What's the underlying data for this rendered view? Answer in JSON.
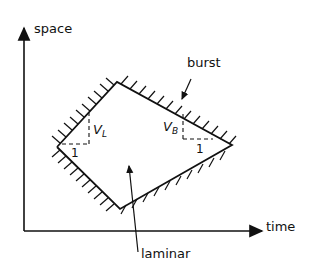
{
  "diagram": {
    "axes": {
      "y_label": "space",
      "x_label": "time"
    },
    "regions": {
      "burst_label": "burst",
      "laminar_label": "laminar"
    },
    "slopes": {
      "left": {
        "rise": "V",
        "rise_sub": "L",
        "run": "1"
      },
      "right": {
        "rise": "V",
        "rise_sub": "B",
        "run": "1"
      }
    },
    "colors": {
      "ink": "#111111",
      "background": "#ffffff"
    }
  }
}
